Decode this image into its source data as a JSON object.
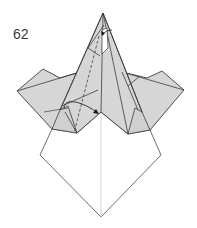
{
  "diagram": {
    "step_number": "62",
    "colors": {
      "paper_colored": "#d6d6d6",
      "paper_white": "#ffffff",
      "line": "#3c3c3c",
      "center_line": "#c8c8c8"
    },
    "annotations": [
      {
        "type": "dashed-valley-line",
        "description": "valley fold line along left flap"
      },
      {
        "type": "curved-arrow",
        "description": "fold flap over toward center"
      },
      {
        "type": "small-arrow",
        "description": "arrow at top near apex"
      }
    ]
  }
}
